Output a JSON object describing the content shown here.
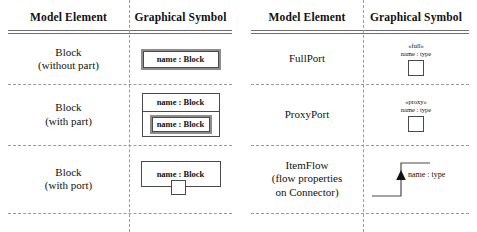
{
  "tables": [
    {
      "id": "left",
      "headers": {
        "col1": "Model Element",
        "col2": "Graphical Symbol"
      },
      "rows": [
        {
          "name": "Block\n(without part)",
          "symbol_kind": "block-simple",
          "box_label": "name : Block"
        },
        {
          "name": "Block\n(with part)",
          "symbol_kind": "block-with-part",
          "outer_label": "name : Block",
          "inner_label": "name : Block"
        },
        {
          "name": "Block\n(with port)",
          "symbol_kind": "block-with-port",
          "box_label": "name : Block"
        }
      ]
    },
    {
      "id": "right",
      "headers": {
        "col1": "Model Element",
        "col2": "Graphical Symbol"
      },
      "rows": [
        {
          "name": "FullPort",
          "symbol_kind": "port",
          "stereotype": "«full»",
          "port_label": "name : type"
        },
        {
          "name": "ProxyPort",
          "symbol_kind": "port",
          "stereotype": "«proxy»",
          "port_label": "name : type"
        },
        {
          "name": "ItemFlow\n(flow properties\non Connector)",
          "symbol_kind": "item-flow",
          "flow_label": "name : type"
        }
      ]
    }
  ],
  "colors": {
    "rule": "#6f6f6f",
    "dash": "#9a9a9a",
    "stroke": "#4a4a4a",
    "text": "#111111",
    "background": "#ffffff"
  }
}
